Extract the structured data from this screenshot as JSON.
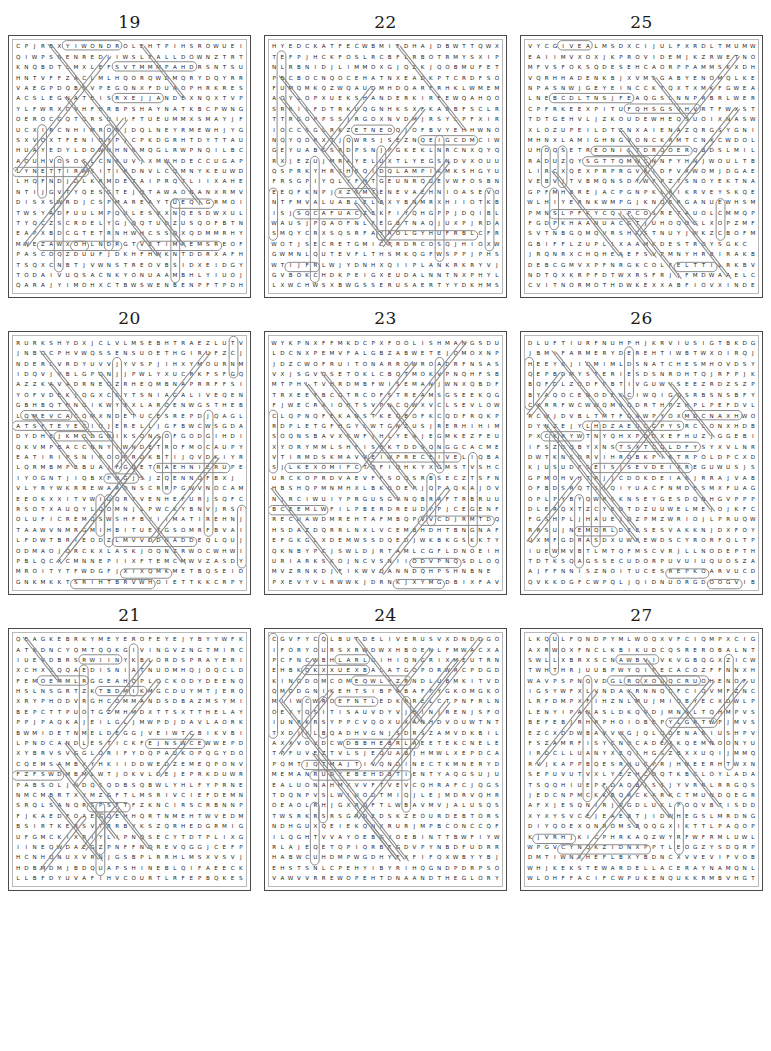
{
  "page": {
    "layout": "3x3 grid of word search puzzles",
    "grid_size": "24 columns x 24 rows"
  },
  "puzzles": [
    {
      "number": "19",
      "rows": [
        "CPJRBXYIWONDROLEHTPIHSROWUEI",
        "QIWPSSENREDLIWSLFALLDOWNZTRT",
        "KNQBDTLMXLEFSVTMMMPAHDRSNTSU",
        "HNTVFFZACLMLHQORQWDMQRYDQYRR",
        "VAEGPDQBSVPEGQNXFDUAOPHRKRES",
        "ACSLEGNATEISRXEJJANDEXNQXTVP",
        "YLFWRXOVHFHRBPSHAYNATKBCPWNG",
        "OEROCGQTGRSUIIFTUEUMMXSMAYJF",
        "UCXIRCNHIMRORJDQLNEYRMEWHJYG",
        "SXVOXTFENIDYPJCPKDGRHTDYTTAU",
        "HUAYEDYLDOWNHNSMQGLRWPNQILBC",
        "AOUHVOSOSLCNRUVJXMWHDECCUGAP",
        "LYNETTIRWSITIRDNVLCQMNYKEUWD",
        "LHQFNDJDLKRMDETAIPRQTLIIXAHE",
        "NTIJGVTYQESGTEJQTAWAONANXRMV",
        "DISXSWRDJCSPMAREAYTUEQJGRMOI",
        "TWSYADFUULMPQULESVXNQESDWXUL",
        "TYQCZSCRDELYGJQQTUDZUSQOFBTN",
        "EAPXBDCGTETRNHWHCSSQXQDMMRHY",
        "MWEZAWXOHLNDRGTVETIMREMSREOF",
        "PASCOQZDUUFJDKHFHWKNTDDRXAFH",
        "TSQXCNBTJVWNSTREOVBSIDXEIDGY",
        "TODAIVUQSACNKYONUAAMBHLYIUOJ",
        "QARAJYIMOHXCTBWSWENBENPFTPDH"
      ]
    },
    {
      "number": "22",
      "rows": [
        "HYEDCKATFECWBMIFDHAJDBWTTQWX",
        "TEFPJHCKFOSLRCBFLRBOTRMYSXIP",
        "NLRBNIDJLIMMOXGJQZKJQOBMUFET",
        "PBCBOCNQOCEHATNXEADKPTCRDFSO",
        "FUMQMKQZWQAUDMHDQARFRHKLWMEM",
        "AOYLOPXUEKSHANDERKIRFEWQAHQO",
        "SRRILFDTRKUQGNHKSXFKARBFSCLR",
        "TTRGOPPSSJRGOXNVDMJRSYLPFXIR",
        "IOCCSGLRKZETNEOQJOFBVYEHHWNO",
        "NQYQORXTJQWRSJSEZNQEIGCDMCIW",
        "GEYUABCSRDPSNJPGKEKLNRCNXQYQ",
        "RXJEZUJMRAYELUXTLYEGSNDVXOUU",
        "QSPRKYHRSHEQIDQLAMPIKMKSHGYU",
        "FRSGPIYQLYFHTGEUNRQUEVWFOSBN",
        "EEQFKNPJXZXMTENEVAEHNIOASEVO",
        "NTFMVALUABLELBXYBNMRXHIIOTKB",
        "ISJSQCAFUACZEKFIYQHGPPJDQIBL",
        "WAUSJPQAOFNLFEGBTNAQJUXPJRDA",
        "SMQYCRXSQSRFAYROLGYHUFRBLCFR",
        "WOTJSECRETGMICPRDRCOSQJHIOXW",
        "GWMNLQUTEVFLTHSMKQGFWSPPJPHS",
        "WTIJFRLWJYDNHXQIIPLANKRKRYVJ",
        "GVBOKCHDKPEIGXEUDALNNTNXPHYL",
        "LXWCHWSXBWGSSERUSAERTYYDKHMS"
      ]
    },
    {
      "number": "25",
      "rows": [
        "VYCGIVEALMSDXCIJULFXRDLTMUMW",
        "EAIIMVXOXJKPROVIDEMJKZRWETNO",
        "MFVSFOKSQDESEHCAORPPAMMSKXDH",
        "VQRHHADENKBJXVMSGABYENOMQLKE",
        "NPASNWJGEYEINCCKTQXTXMKFGWEA",
        "LNEBCDLTNSJFEAQGSLNNPRBRLWER",
        "CPFRKEEXPITUFQHSGSVHVRTFWXST",
        "TDTGEHVLJZKOUDEWHEQSUOIXNASW",
        "XLOZUPEILDTZNXAIENAZQRGSYGNI",
        "MHNXLAMIGHNGVONCKRMTCNXCWDOL",
        "UHOQSETREONISTDRQOERQBDSLMIL",
        "RADUZQYSGTTQMWCNNFYHNJWOULTB",
        "LIRCXQEXPRPRGVKIDFVXWOMJDGAE",
        "VEBVJTVBMQNSDYWFPZTSNOYEKTNA",
        "GPFMHBREJACPGNPKLRIKRVEYSKQE",
        "WLHIYERNKWMPGJKNQERGANUEWHSM",
        "PMNSLPFKYCQIPCOSRETAUOLCMMQP",
        "FGDPKHAANUACGTJUHOQOGLXOPZMF",
        "SVTNBGQMQVRSHKSTNUYJWKZCBOFM",
        "GBIFFLZUPLIXAAMKDESTROYSGKC",
        "JRQNRXCHQHEAEFSVPMNYHRBIRAKB",
        "DEBCGMVXPFNRGKCOLFELTTILRKBV",
        "NDTQXKRPFDTWXRSFRJJFMDWAAELC",
        "CVITNORMOTHDWKEXXABFIOVXINDE"
      ]
    },
    {
      "number": "20",
      "rows": [
        "RURKSHYDXJCLVLMSEBHTRAEZLUTV",
        "JNBOCPHVWQSSENSUOETHGIRUFZCJ",
        "NDERLVRDYUVVJYVSPJIHXYMOURNM",
        "IDQVJVBLGPQNJJPWLYXUCRKFSFGQ",
        "AZZKAVADRNEQZRHEQMBNAPRRFFSI",
        "YOFVDEKJQGXCKYTSNIAGALIVEQEN",
        "GBHBQTHNGIKWYXXLARQENWGSTHEB",
        "LQMEVCACQMXNDETUCESREPDJQAGL",
        "ATSFTEYECIOJERELLJGFBWCWSGDA",
        "DYDHEJKMODGNIKSONSOFGODGIHDI",
        "QKVMPBACCNNYIWNDETROFMOCAUPY",
        "EATIRIPSNIROOPRDKBTIJQVDKIYR",
        "LQRMBMPEBUAJFGQETRAEHNIERUPE",
        "IYOGNTJIQBXPNGJSJZQENNQFBXJ",
        "VLYRYWKRREWARDNSCRRPGWVNOCAM",
        "EEOKXXITVWIUQRYVENHEFURJSQFC",
        "RSOTXAUQYLQOMNJLPWCKYBNVJRSI",
        "OLUFICREMQSWSHFBYIIMATIREHNJ",
        "TAAWVNMRGMIHBITUETGSOMRFBVAI",
        "LFDWTBRIEODZLMVVDDNADDEQLQUJ",
        "ODMAOJQRCKXLASKJOQNZRWOCWHWI",
        "PBLQCXCMNNEPIIXFTEMCMWVZASDY",
        "MROITYTFWDGFJXIXQMKMETBQSEID",
        "GNKMKKTSRIHTBRVWHOIETTKKCRPY"
      ]
    },
    {
      "number": "23",
      "rows": [
        "WYKPNXFFMKDCPXFOOLISHMANGSDU",
        "LDCNXPEMVFALGBZABWETEJOMOXNP",
        "JDZCWOFRUITONARROWROADRFNSAS",
        "VXJSGVQSETOKLCBQTMOKVPNQHFSB",
        "MTPHLTVHRDMBFWISEMANJWNXQBDF",
        "TRXEEYBCGTRCOFSTREAMSGSEEKQG",
        "FJWECRAIOHTSVPNCQWXVCLSEVLOW",
        "CLQPNQFEKANSTKEQBOFKCQDFRQKP",
        "RDPLETGFHGYLWTGNZUSJRERHIHIM",
        "SOQNSBAVXSWFJHLYEAJEGMKEZFEU",
        "XYORYMMLSHFISHKTDDSQNGGCACME",
        "VTIRMDSKMAVVEIWPRECEIVELIQBA",
        "SJLKEXOMIFCTQFIQHKYXGMSTVSHC",
        "URCKOPRDVAEVFFSOQSRBSECZTSFN",
        "HBSHQPMNMHXLBKUOEPJQPAQKAJOV",
        "NJRCIWUIYPRGUSGVNQBRRFTRBRUU",
        "BCEEMLWFILPBERDREUDPPJCEGENF",
        "RECUAWDMREHTAFMBQPVVCDJRMTDQ",
        "HSDAZDQRRLNXLVCEMBHDHTBNGNAF",
        "EFGKGLXDEMWSSDQEDJWKBKGSKKTY",
        "QKNBYPCJSWLDJRTAMLCGFLDNOEIH",
        "URIARKSKOJNCVSNIIODVPNQSDLOQ",
        "MVZRNKDJFIKWVQANNDQHPSHNBNE",
        "PXEVYVLRWWKJDRNKJXYMGDBIXFAV"
      ]
    },
    {
      "number": "26",
      "rows": [
        "DLUFTIURFNUHPHJKRVIUSIGTBKDG",
        "JBMIFARMERYDEREHTIWBTWXOIRQJ",
        "HEEYKJICMIMLDSNATCHESMHOVDSY",
        "QEPBDMYSTERIESDSNROHTQJRFPJK",
        "BQFDLZODFPBTIVGUWVSEEZRDZSZP",
        "BYAQOCENODEKCIWQIGQSRBSNSBFY",
        "CXRRFWCWWQMSQDRTHPZHPLPEFDVL",
        "RCWJDVBLTMTFQAWPYOXMDCNAXHWO",
        "DYNZEJYLHDZAEUCGPYSRCLONXHDB",
        "PXCKRYWTNYQHXPDDXEFHUZJGGEBI",
        "IFSZDQBYXNSTSXTCGLDFYSYXVLNR",
        "DWTKNSDRVIHRDBKPIKTRPOLDPCXD",
        "KJUSUDFSEISJSEVDEIXREGUWUSJS",
        "GPMOHVHTRJJCDOKDEIAKJRRAJVAB",
        "OFBDSRQTSIQIYUACFNMDESMXFUAG",
        "OPLPYBYQWRSKNSEYGESDQNHGVPPP",
        "DLERQXTZCYEDTDZUUWELMEJOJKFC",
        "FGSHPLJHAUEJQZPMZWRIOJLPRUQW",
        "RRSUJNEMQRLDEESESVAKKNJDXFOY",
        "UXMFGDRASDXUWREWDSCYRORFQLTP",
        "IUEWMVBTLMTQFMSCVRJLLNODEPTH",
        "TDTKSQAGSSECUDORPUVUIUQUOSZA",
        "AJFFNNISZNOITUCESREPKOARVUCD",
        "QVKKDGFCWPQLJQIDNUORGDOOGVIB"
      ]
    },
    {
      "number": "21",
      "rows": [
        "QEAGKEBRKYMEYEROFEYEJYBYYWFK",
        "ATKDNCYQMTQQKGIVINGVZNGTMIRC",
        "IUEVDBRSRWIINYKBLORDSPRAYERI",
        "XCHXGQQAEDISNIATNUOMHQJOQCLD",
        "FEMOEMMLRGGEAHQPLQCKODYDEENQ",
        "HSLNSGRTZKTBDMIKMGCDUYMTJERQ",
        "XRYPHODVRGHCOMMANDSDBAZMSYMI",
        "BEPCTTPUOTGZMHMDXTTSXTTHELAY",
        "PPJPAQKAJEILGLJMWPDJDAVLAORK",
        "BWMIDETNMELDEGGJVEIWTCBIKVBI",
        "LPNDCANDLESTICKFEJNSWCEWWEPD",
        "XYBRVSVGGLORIFYDQPAUKOPQGYDO",
        "CQEMSAMBXYHKIIDDWEDZEMEQPONV",
        "FZFSWDMBMLWTJOKVLDEJEPRKDUWR",
        "PABSOLJNDQSQDBSQBWLYHLFYPRNE",
        "NMCMBRTXYMZGFTLMSRIVCIEFDEMN",
        "SRQLSANQRSPSFTFZKNCIRSCRBNNP",
        "FJKAEDFOAEGQEHHQRTNMEHTWVEDM",
        "BSIRTKERSVTRRBYKSZQRHEDGRMIG",
        "UFGMCKIXRIYLIPNQSECYTDTPLIXG",
        "IINEQWDAEGZPNFFNQREVQGGJCEFP",
        "HCNHQNUXVRNJGSBPLRRHLMSXVSVJ",
        "HDBMDMJBDQUAPSHINEBLQIFAEECK",
        "LLBFDYUVAFIHVCOURTLRFEPBQKES"
      ]
    },
    {
      "number": "24",
      "rows": [
        "CGVFYCQLBUTDELIVERUSVXDNDDGO",
        "IFORYOURSXRWDWXHBOENLFMWACXA",
        "PCFNCWBHLARLUIHIQNGRIXMEUTRN",
        "EHBKQKXXUEXBALATGOPORWRCPDGD",
        "KINGDOMCOMEQWLYZRNDLUBMKITVD",
        "QMODGNIKEHTSIBPABAFPYGKOMGKO",
        "MIIWCWROEFNTLEDKRRELCTPNFRLN",
        "OEYYQSITISAUVDYVJHINJRENJSFO",
        "IUNRKRSYPPCVQOXUXANHDVOUWTNT",
        "TXDJXLBQADHVGNJSDRSZAMVDKBIL",
        "AXXVOVDCWDBBHEBRLREETEKCNELE",
        "TPFUVEZTVLSJEQUABJHMWLXEPDCA",
        "PQMTJQTMAJTIVQNDINECTKMNERYD",
        "MEMANRUDYEBEHDBTIENTYAQGSUJU",
        "EALUONAHMXVVFTVEVCQHRAFCJQGS",
        "TDQNPVSLWIUODTMIQJLEJMDRVQHR",
        "OEAOLRHJGXRQFTLWBAVMVJALUSQS",
        "TWSRKRSRSGRDEDSKZEOURDEBTORS",
        "NDHGUXQEIEKQNXRURJMPBCONCCQF",
        "ILQGHTVVAYOEBGYOEBINTTBWFIYW",
        "RLAJEQETQPIQRBFGDVPYNBDFUDRR",
        "HABWCUHDMPWGDHYFXFIFQXWBYYBJ",
        "EHSTSNLCPEHYIBYRIHQGNDPDRPSO",
        "VAWVVRREWOPEHTDNAANDTHEGLORY"
      ]
    },
    {
      "number": "27",
      "rows": [
        "LKQULFQNDPYMLWOQXVFCIQMPXCIG",
        "AXRWOXFNCLKBIKUDCQSREROBALNT",
        "SWLLXBRXSCNAWBVIVKVGBQGXZICW",
        "TWHTHRJUUBPWYQIPECACOZFFNNXH",
        "WAVPSPNQVDGLRQXOUQCRUOHENOFU",
        "IGSYWFXLVNDAXRNNQCFCIQVMFZNC",
        "LRFDMPXFIHZNLMUJMIOBYECXDWLP",
        "LENYIPANASLDKQVDJMNSLTQHMPVS",
        "BEFEBJRHRPHOIOBEPYLGRTWPJMVS",
        "EZCXDDWBAVVWGJQLQDENARIUSHPV",
        "FSZAMRFISYCNDCADEXKQEMNOONYU",
        "IRDCLLUANYXEQIHGSZBXXUQIJMMQ",
        "RVJKAPPBQESRNUCPRJHNEERHTWXN",
        "SEPUVUTVXLYEZHCDQTKBCLOYLADA",
        "TSQQHIUEPFDAQBJSSJYVRRLRRGQS",
        "JEDCNPMCKKBQRCKARKCTMUNDQEGR",
        "AFXJESQNIRJVGDLUKLPOQVBTISDD",
        "XYXYSVCEJEAEBTJIDWHEGSLMRDNG",
        "DIYQOEXQNROMSBQQGXIKTTLPAQOP",
        "KJVRHJKICPHRKAQZWYRFWFRMLUWL",
        "WPGVCYNQKZIDNXPPTLEOGZYSDQRP",
        "DMTIWNXHEFLBXYBDNCXVVEVIFVOB",
        "WHJKEKSTEWARDELLACERAYNAMQNL",
        "WLOHFFACIFCWPUKENQUKKRMBVHGT"
      ]
    }
  ],
  "marks": {
    "stroke_color": "#8c8c8c",
    "description": "circled and lined found-word markers overlaying the letter grids"
  }
}
